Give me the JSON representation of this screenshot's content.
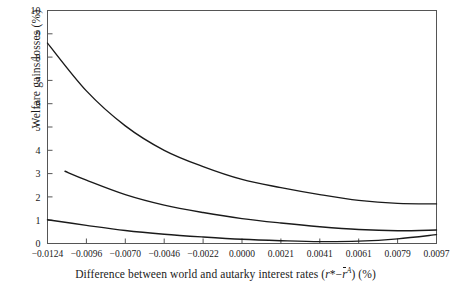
{
  "chart_data": {
    "type": "line",
    "title": "",
    "xlabel": "Difference between world and autarky interest rates (r*−r̄ᴬ) (%)",
    "ylabel": "Welfare gains/losses (%)",
    "x_tick_labels": [
      "-0.0124",
      "-0.0096",
      "-0.0070",
      "-0.0046",
      "-0.0022",
      "0.0000",
      "0.0021",
      "0.0041",
      "0.0061",
      "0.0079",
      "0.0097"
    ],
    "x_tick_values": [
      -0.0124,
      -0.0096,
      -0.007,
      -0.0046,
      -0.0022,
      0.0,
      0.0021,
      0.0041,
      0.0061,
      0.0079,
      0.0097
    ],
    "y_tick_labels": [
      "0",
      "1",
      "2",
      "3",
      "4",
      "5",
      "6",
      "7",
      "8",
      "9",
      "10"
    ],
    "ylim": [
      0,
      10
    ],
    "xlim_index": [
      0,
      10
    ],
    "grid": false,
    "legend": false,
    "line_color": "#1a1a1a",
    "frame_color": "#555555",
    "series": [
      {
        "name": "upper-curve",
        "x_index": [
          0,
          1,
          2,
          3,
          4,
          5,
          6,
          7,
          8,
          9,
          10
        ],
        "values": [
          8.6,
          6.55,
          5.05,
          4.0,
          3.3,
          2.75,
          2.4,
          2.1,
          1.85,
          1.72,
          1.7
        ]
      },
      {
        "name": "middle-curve",
        "x_index": [
          0.45,
          1,
          2,
          3,
          4,
          5,
          6,
          7,
          8,
          9,
          10
        ],
        "values": [
          3.1,
          2.72,
          2.1,
          1.65,
          1.33,
          1.07,
          0.88,
          0.72,
          0.6,
          0.55,
          0.58
        ]
      },
      {
        "name": "lower-curve",
        "x_index": [
          0,
          1,
          2,
          3,
          4,
          5,
          6,
          7,
          8,
          9,
          10
        ],
        "values": [
          1.02,
          0.78,
          0.56,
          0.4,
          0.28,
          0.18,
          0.12,
          0.08,
          0.1,
          0.2,
          0.38
        ]
      }
    ]
  },
  "axis": {
    "x_title_prefix": "Difference between world and autarky interest rates (",
    "x_title_r_star": "r",
    "x_title_star": "*",
    "x_title_minus": "−",
    "x_title_rbar": "r",
    "x_title_sup_a": "A",
    "x_title_suffix": ") (%)",
    "y_title": "Welfare gains/losses (%)"
  }
}
